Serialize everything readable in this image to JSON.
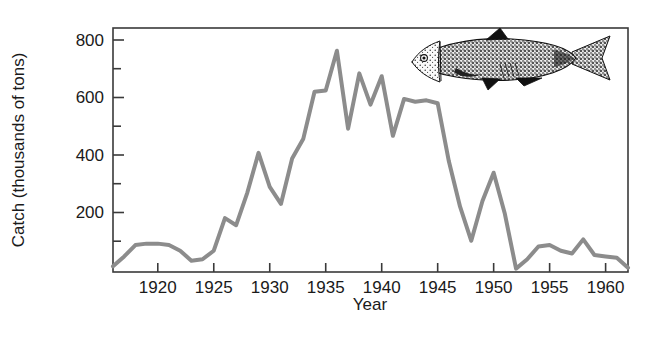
{
  "figure": {
    "caption_present": false,
    "illustration": "sardine-fish-illustration"
  },
  "chart_data": {
    "type": "line",
    "title": "",
    "xlabel": "Year",
    "ylabel": "Catch (thousands of tons)",
    "xlim": [
      1916,
      1962
    ],
    "ylim": [
      0,
      860
    ],
    "xticks": [
      1920,
      1925,
      1930,
      1935,
      1940,
      1945,
      1950,
      1955,
      1960
    ],
    "xtick_labels": [
      "1920",
      "1925",
      "1930",
      "1935",
      "1940",
      "1945",
      "1950",
      "1955",
      "1960"
    ],
    "yticks": [
      200,
      400,
      600,
      800
    ],
    "ytick_labels": [
      "200",
      "400",
      "600",
      "800"
    ],
    "y_minor_ticks": [
      100,
      300,
      500,
      700
    ],
    "grid": false,
    "legend": null,
    "line_color": "#8c8c8c",
    "line_width": 4,
    "series": [
      {
        "name": "Catch",
        "x": [
          1916,
          1917,
          1918,
          1919,
          1920,
          1921,
          1922,
          1923,
          1924,
          1925,
          1926,
          1927,
          1928,
          1929,
          1930,
          1931,
          1932,
          1933,
          1934,
          1935,
          1936,
          1937,
          1938,
          1939,
          1940,
          1941,
          1942,
          1943,
          1944,
          1945,
          1946,
          1947,
          1948,
          1949,
          1950,
          1951,
          1952,
          1953,
          1954,
          1955,
          1956,
          1957,
          1958,
          1959,
          1960,
          1961,
          1962
        ],
        "values": [
          20,
          55,
          95,
          100,
          100,
          95,
          75,
          40,
          45,
          75,
          190,
          165,
          280,
          420,
          300,
          240,
          400,
          470,
          635,
          640,
          780,
          505,
          700,
          590,
          690,
          480,
          610,
          600,
          605,
          595,
          390,
          230,
          110,
          250,
          350,
          205,
          12,
          45,
          90,
          95,
          75,
          65,
          115,
          60,
          55,
          50,
          15
        ]
      }
    ]
  }
}
